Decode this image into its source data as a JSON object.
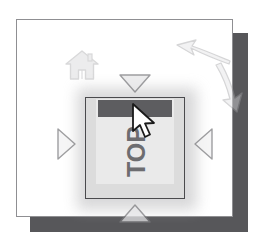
{
  "panel": {
    "background_color": "#ffffff",
    "border_color": "#8f8f92",
    "shadow_color": "#57575a"
  },
  "icons": {
    "home": {
      "name": "home-icon",
      "tooltip": "Home",
      "color": "#b0b0b2"
    },
    "rotate_counterclockwise": {
      "name": "rotate-counterclockwise-icon",
      "tooltip": "Rotate left",
      "color": "#a8a8aa"
    },
    "rotate_clockwise": {
      "name": "rotate-clockwise-icon",
      "tooltip": "Rotate right",
      "color": "#a8a8aa"
    }
  },
  "page_preview": {
    "label": "TOP",
    "label_color": "#6d6d70",
    "header_bar_color": "#5d5d60",
    "page_color": "#eaeaea",
    "frame_color": "#dcdcdc",
    "border_color": "#4a4a4d"
  },
  "navigation": {
    "up": {
      "name": "nav-arrow-up",
      "direction": "down-pointing",
      "color": "#9a9a9d"
    },
    "down": {
      "name": "nav-arrow-down",
      "direction": "up-pointing",
      "color": "#9a9a9d"
    },
    "left": {
      "name": "nav-arrow-left",
      "direction": "right-pointing",
      "color": "#9a9a9d"
    },
    "right": {
      "name": "nav-arrow-right",
      "direction": "left-pointing",
      "color": "#9a9a9d"
    }
  },
  "cursor": {
    "name": "mouse-cursor",
    "fill": "#ffffff",
    "outline": "#1a1a1a"
  }
}
